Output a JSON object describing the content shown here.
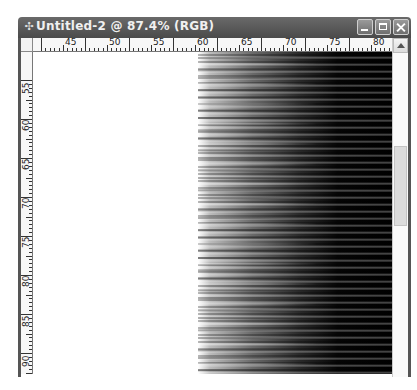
{
  "window": {
    "title": "Untitled-2 @ 87.4% (RGB)",
    "document_name": "Untitled-2",
    "zoom": "87.4%",
    "color_mode": "RGB",
    "icon": "photoshop-document-icon",
    "buttons": {
      "minimize": "minimize",
      "maximize": "maximize",
      "close": "close"
    }
  },
  "rulers": {
    "horizontal": {
      "labels": [
        {
          "text": "45",
          "x": 30
        },
        {
          "text": "50",
          "x": 74
        },
        {
          "text": "55",
          "x": 118
        },
        {
          "text": "60",
          "x": 162
        },
        {
          "text": "65",
          "x": 206
        },
        {
          "text": "70",
          "x": 250
        },
        {
          "text": "75",
          "x": 294
        },
        {
          "text": "80",
          "x": 338
        }
      ]
    },
    "vertical": {
      "labels": [
        {
          "text": "55",
          "y": 28
        },
        {
          "text": "60",
          "y": 65
        },
        {
          "text": "65",
          "y": 104
        },
        {
          "text": "70",
          "y": 143
        },
        {
          "text": "75",
          "y": 182
        },
        {
          "text": "80",
          "y": 221
        },
        {
          "text": "85",
          "y": 261
        },
        {
          "text": "90",
          "y": 301
        }
      ]
    }
  },
  "canvas": {
    "background": "#ffffff",
    "content": "black-to-white horizontal gradient with noisy horizontal streaks",
    "gradient_dark": "#000000",
    "gradient_light": "#ffffff"
  },
  "scrollbar": {
    "vertical": {
      "thumb_position": "middle"
    }
  }
}
